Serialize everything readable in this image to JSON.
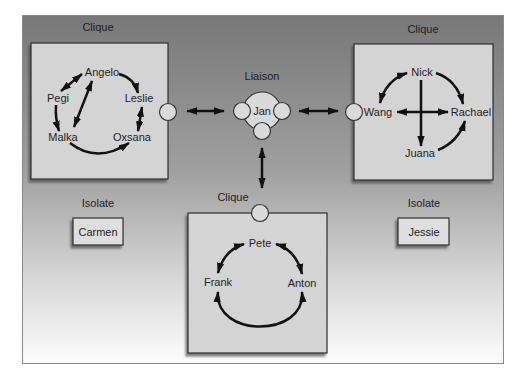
{
  "figure": {
    "liaison": {
      "label": "Liaison",
      "name": "Jan"
    },
    "cliques": [
      {
        "label": "Clique",
        "position": "top-left",
        "members": [
          "Angelo",
          "Pegi",
          "Leslie",
          "Malka",
          "Oxsana"
        ],
        "edges": [
          {
            "from": "Pegi",
            "to": "Angelo",
            "direction": "both"
          },
          {
            "from": "Angelo",
            "to": "Malka",
            "direction": "both"
          },
          {
            "from": "Angelo",
            "to": "Leslie",
            "direction": "forward"
          },
          {
            "from": "Pegi",
            "to": "Malka",
            "direction": "forward"
          },
          {
            "from": "Leslie",
            "to": "Oxsana",
            "direction": "both"
          },
          {
            "from": "Malka",
            "to": "Oxsana",
            "direction": "forward"
          }
        ]
      },
      {
        "label": "Clique",
        "position": "top-right",
        "members": [
          "Nick",
          "Wang",
          "Rachael",
          "Juana"
        ],
        "edges": [
          {
            "from": "Nick",
            "to": "Wang",
            "direction": "both"
          },
          {
            "from": "Nick",
            "to": "Rachael",
            "direction": "forward"
          },
          {
            "from": "Nick",
            "to": "Juana",
            "direction": "forward"
          },
          {
            "from": "Wang",
            "to": "Rachael",
            "direction": "both"
          },
          {
            "from": "Juana",
            "to": "Rachael",
            "direction": "forward"
          }
        ]
      },
      {
        "label": "Clique",
        "position": "bottom-center",
        "members": [
          "Pete",
          "Frank",
          "Anton"
        ],
        "edges": [
          {
            "from": "Pete",
            "to": "Frank",
            "direction": "both"
          },
          {
            "from": "Pete",
            "to": "Anton",
            "direction": "both"
          },
          {
            "from": "Frank",
            "to": "Anton",
            "direction": "both"
          }
        ]
      }
    ],
    "liaison_links": [
      {
        "clique_index": 0,
        "to": "Jan",
        "direction": "both"
      },
      {
        "clique_index": 1,
        "to": "Jan",
        "direction": "both"
      },
      {
        "clique_index": 2,
        "to": "Jan",
        "direction": "both"
      }
    ],
    "isolates": [
      {
        "label": "Isolate",
        "name": "Carmen"
      },
      {
        "label": "Isolate",
        "name": "Jessie"
      }
    ]
  },
  "colors": {
    "background_top": "#787878",
    "background_mid": "#a2a2a2",
    "background_bottom": "#fdfdfd",
    "box_fill": "#d4d4d4",
    "box_border": "#2e2e2e",
    "arrow": "#111111",
    "text": "#1e1e1e"
  }
}
